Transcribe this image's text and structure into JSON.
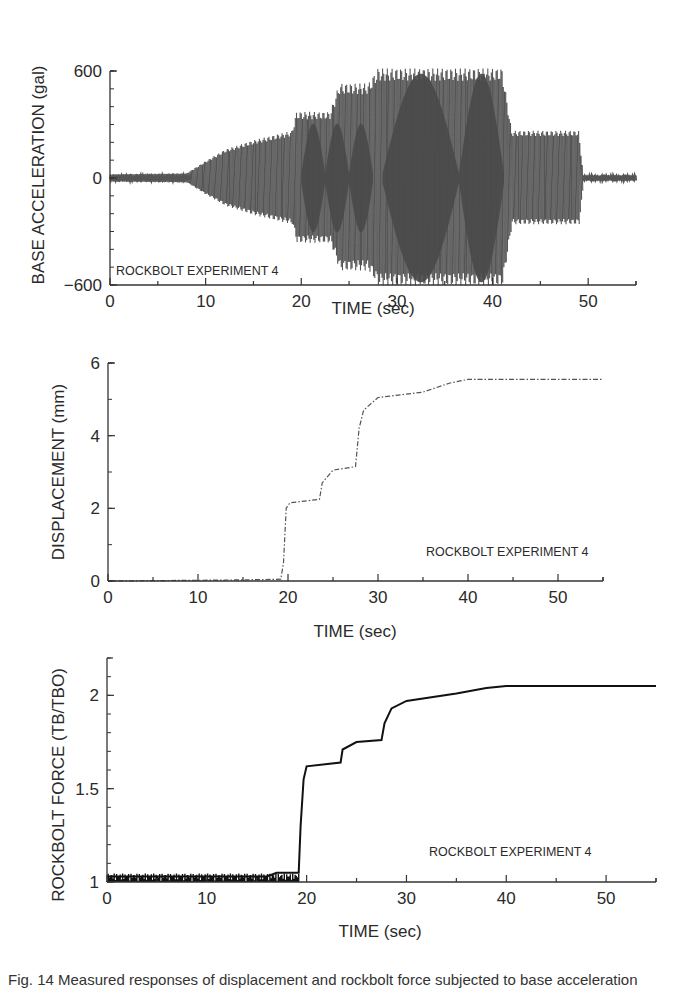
{
  "chart_data": [
    {
      "type": "line",
      "title": "",
      "annotation": "ROCKBOLT EXPERIMENT 4",
      "xlabel": "TIME (sec)",
      "ylabel": "BASE ACCELERATION (gal)",
      "xlim": [
        0,
        55
      ],
      "ylim": [
        -600,
        600
      ],
      "x_ticks": [
        0,
        10,
        20,
        30,
        40,
        50
      ],
      "y_ticks": [
        -600,
        0,
        600
      ],
      "y_tick_labels": [
        "−600",
        "0",
        "600"
      ],
      "grid": false,
      "legend": null,
      "color": "#555555",
      "description": "Oscillatory base acceleration time history; envelope amplitude (gal) vs time",
      "envelope": {
        "x": [
          0,
          8,
          10,
          12,
          15,
          19,
          19.5,
          23,
          24,
          27,
          28,
          41,
          42,
          49,
          49.5,
          55
        ],
        "amplitude": [
          20,
          25,
          90,
          150,
          200,
          250,
          350,
          350,
          500,
          500,
          580,
          580,
          250,
          250,
          15,
          15
        ]
      }
    },
    {
      "type": "line",
      "title": "",
      "annotation": "ROCKBOLT EXPERIMENT 4",
      "xlabel": "TIME (sec)",
      "ylabel": "DISPLACEMENT (mm)",
      "xlim": [
        0,
        55
      ],
      "ylim": [
        0,
        6
      ],
      "x_ticks": [
        0,
        10,
        20,
        30,
        40,
        50
      ],
      "y_ticks": [
        0,
        2,
        4,
        6
      ],
      "grid": false,
      "legend": null,
      "line_style": "dash-dot",
      "color": "#555555",
      "x": [
        0,
        15,
        19.2,
        19.5,
        19.8,
        20.2,
        23.5,
        23.8,
        25,
        27.5,
        27.9,
        28.4,
        30,
        35,
        38,
        40,
        55
      ],
      "y": [
        0,
        0.03,
        0.05,
        0.5,
        2.0,
        2.15,
        2.25,
        2.7,
        3.05,
        3.15,
        4.2,
        4.7,
        5.05,
        5.2,
        5.45,
        5.55,
        5.55
      ]
    },
    {
      "type": "line",
      "title": "",
      "annotation": "ROCKBOLT EXPERIMENT 4",
      "xlabel": "TIME (sec)",
      "ylabel": "ROCKBOLT FORCE (TB/TBO)",
      "xlim": [
        0,
        55
      ],
      "ylim": [
        1,
        2.2
      ],
      "x_ticks": [
        0,
        10,
        20,
        30,
        40,
        50
      ],
      "y_ticks": [
        1,
        1.5,
        2
      ],
      "grid": false,
      "legend": null,
      "color": "#111111",
      "x": [
        0,
        16,
        17,
        19.2,
        19.4,
        19.7,
        20,
        23.4,
        23.6,
        25,
        27.5,
        27.8,
        28.5,
        30,
        35,
        38,
        40,
        55
      ],
      "y": [
        1.03,
        1.03,
        1.05,
        1.05,
        1.3,
        1.55,
        1.62,
        1.64,
        1.71,
        1.75,
        1.76,
        1.85,
        1.93,
        1.97,
        2.01,
        2.04,
        2.05,
        2.05
      ]
    }
  ],
  "caption": "Fig. 14  Measured responses of displacement and rockbolt force subjected to base acceleration"
}
